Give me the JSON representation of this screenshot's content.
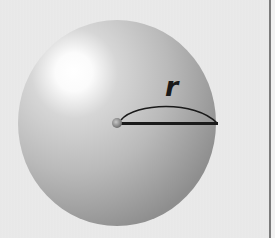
{
  "diagram": {
    "type": "sphere-radius",
    "radius_label": "r",
    "colors": {
      "background": "#e8e8e8",
      "sphere_light": "#ffffff",
      "sphere_mid": "#bdbdbd",
      "sphere_dark": "#8f8f8f",
      "line": "#1a1a1a",
      "border": "#7a7a7a"
    }
  }
}
